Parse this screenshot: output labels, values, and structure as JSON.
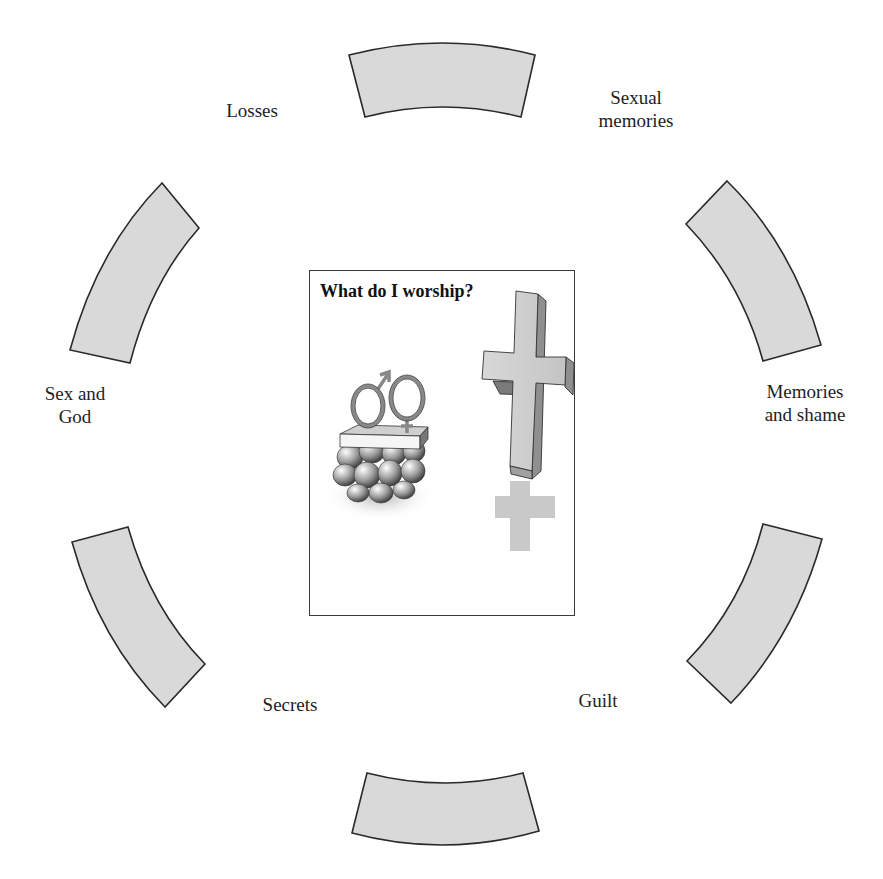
{
  "card": {
    "title": "What do I worship?",
    "illustration": [
      "gender-symbols-on-stone-altar",
      "cross-with-shadow"
    ]
  },
  "labels": {
    "top_left": "Losses",
    "top_right": "Sexual\nmemories",
    "left": "Sex and\nGod",
    "right": "Memories\nand shame",
    "bottom_left": "Secrets",
    "bottom_right": "Guilt"
  },
  "segments": [
    {
      "position": "top"
    },
    {
      "position": "upper-right"
    },
    {
      "position": "lower-right"
    },
    {
      "position": "bottom"
    },
    {
      "position": "lower-left"
    },
    {
      "position": "upper-left"
    }
  ],
  "colors": {
    "segment_fill": "#d9d9d9",
    "segment_stroke": "#2a2a2a",
    "background": "#ffffff"
  }
}
